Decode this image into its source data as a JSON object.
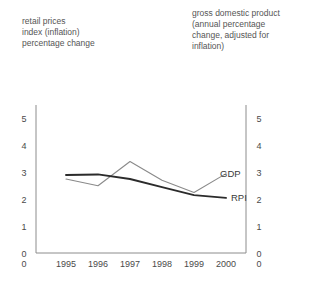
{
  "captions": {
    "left": "retail prices\nindex (inflation)\npercentage change",
    "right": "gross domestic product\n(annual percentage\nchange, adjusted for\ninflation)"
  },
  "colors": {
    "rpi_line": "#2b2b2b",
    "gdp_line": "#8a8a8a",
    "axis": "#8c8c8c",
    "text": "#4a4a4a",
    "background": "#ffffff"
  },
  "axes": {
    "left_ticks": [
      "0",
      "1",
      "2",
      "3",
      "4",
      "5"
    ],
    "right_ticks": [
      "0",
      "1",
      "2",
      "3",
      "4",
      "5"
    ],
    "x_outer_left": "0",
    "x_outer_right": "0"
  },
  "series_labels": {
    "gdp": "GDP",
    "rpi": "RPI"
  },
  "chart_data": {
    "type": "line",
    "title": "",
    "subtitle": "",
    "xlabel": "",
    "ylabel": "percentage change",
    "categories": [
      "1995",
      "1996",
      "1997",
      "1998",
      "1999",
      "2000"
    ],
    "x": [
      1995,
      1996,
      1997,
      1998,
      1999,
      2000
    ],
    "ylim": [
      0,
      5.5
    ],
    "yticks": [
      0,
      1,
      2,
      3,
      4,
      5
    ],
    "grid": false,
    "legend": "inline-end-labels",
    "dual_axis": true,
    "series": [
      {
        "name": "RPI",
        "label": "retail prices index (inflation) percentage change",
        "axis": "left",
        "color": "#2b2b2b",
        "values": [
          2.9,
          2.92,
          2.75,
          2.45,
          2.15,
          2.05
        ]
      },
      {
        "name": "GDP",
        "label": "gross domestic product (annual percentage change, adjusted for inflation)",
        "axis": "right",
        "color": "#8a8a8a",
        "values": [
          2.75,
          2.5,
          3.4,
          2.7,
          2.25,
          2.95
        ]
      }
    ]
  }
}
